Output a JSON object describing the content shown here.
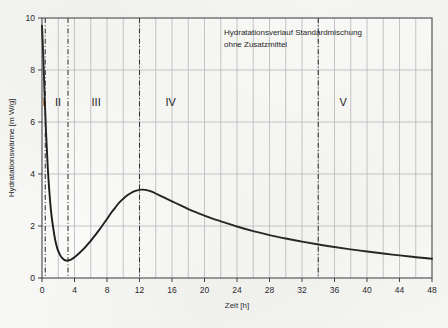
{
  "chart_data": {
    "type": "line",
    "title": "",
    "annotation_lines": [
      "Hydratationsverlauf Standardmischung",
      "ohne Zusatzmittel"
    ],
    "xlabel": "Zeit [h]",
    "ylabel": "Hydratationswärme [m W/g]",
    "xlim": [
      0,
      48
    ],
    "ylim": [
      0,
      10
    ],
    "xticks": [
      0,
      4,
      8,
      12,
      16,
      20,
      24,
      28,
      32,
      36,
      40,
      44,
      48
    ],
    "xtick_labels": [
      "0",
      "4",
      "8",
      "12",
      "16",
      "20",
      "24",
      "28",
      "32",
      "36",
      "40",
      "44",
      "48"
    ],
    "yticks": [
      0,
      2,
      4,
      6,
      8,
      10
    ],
    "ytick_labels": [
      "0",
      "2",
      "4",
      "6",
      "8",
      "10"
    ],
    "minor_x_step": 2,
    "grid": "major horizontal every 2 units, vertical every 2 hours",
    "legend": "none",
    "line_color": "#1a1a1a",
    "grid_color": "#b8b8bc",
    "frame_color": "#44444a",
    "series": [
      {
        "name": "Hydratationswärme Standardmischung ohne Zusatzmittel",
        "x": [
          0,
          0.15,
          0.3,
          0.5,
          0.7,
          0.9,
          1.1,
          1.3,
          1.6,
          1.9,
          2.2,
          2.5,
          2.8,
          3.1,
          3.5,
          4,
          4.5,
          5,
          5.5,
          6,
          6.5,
          7,
          7.5,
          8,
          8.5,
          9,
          9.5,
          10,
          10.5,
          11,
          11.5,
          12,
          12.4,
          13,
          13.5,
          14,
          15,
          16,
          17,
          18,
          19,
          20,
          21,
          22,
          24,
          26,
          28,
          30,
          32,
          34,
          36,
          38,
          40,
          42,
          44,
          46,
          48
        ],
        "y": [
          9.7,
          8.6,
          7.2,
          5.6,
          4.3,
          3.35,
          2.6,
          2.1,
          1.5,
          1.12,
          0.9,
          0.76,
          0.69,
          0.67,
          0.7,
          0.8,
          0.93,
          1.08,
          1.25,
          1.43,
          1.63,
          1.83,
          2.05,
          2.27,
          2.5,
          2.7,
          2.9,
          3.05,
          3.18,
          3.28,
          3.35,
          3.39,
          3.4,
          3.37,
          3.32,
          3.25,
          3.1,
          2.95,
          2.8,
          2.65,
          2.52,
          2.4,
          2.28,
          2.18,
          1.98,
          1.8,
          1.65,
          1.52,
          1.4,
          1.29,
          1.19,
          1.1,
          1.02,
          0.94,
          0.87,
          0.8,
          0.74
        ]
      }
    ],
    "phase_dividers": [
      {
        "x": 0.4,
        "style": "dash-dot"
      },
      {
        "x": 3.2,
        "style": "dash-dot"
      },
      {
        "x": 12.0,
        "style": "dash-dot"
      },
      {
        "x": 34.0,
        "style": "dash-dot"
      }
    ],
    "phase_labels": [
      {
        "label": "I",
        "x": 0.05,
        "y": 6.6
      },
      {
        "label": "II",
        "x": 1.6,
        "y": 6.6
      },
      {
        "label": "III",
        "x": 6.1,
        "y": 6.6
      },
      {
        "label": "IV",
        "x": 15.2,
        "y": 6.6
      },
      {
        "label": "V",
        "x": 36.6,
        "y": 6.6
      }
    ],
    "notable_points": {
      "initial_peak": {
        "x": 0,
        "y": 9.7
      },
      "dormant_minimum": {
        "x": 3.1,
        "y": 0.67
      },
      "main_peak": {
        "x": 12.4,
        "y": 3.4
      },
      "end_value": {
        "x": 48,
        "y": 0.74
      }
    }
  }
}
